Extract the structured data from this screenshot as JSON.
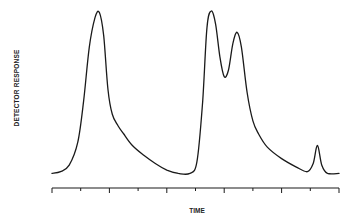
{
  "chart_data": {
    "type": "line",
    "title": "",
    "xlabel": "TIME",
    "ylabel": "DETECTOR RESPONSE",
    "grid": false,
    "legend": null,
    "x_ticks": {
      "count": 11,
      "labels": []
    },
    "y_ticks": {
      "count": 0,
      "labels": []
    },
    "xlim": [
      0,
      10
    ],
    "ylim": [
      0,
      1
    ],
    "series": [
      {
        "name": "chromatogram",
        "x": [
          0.0,
          0.3,
          0.6,
          0.9,
          1.1,
          1.3,
          1.5,
          1.65,
          1.8,
          1.95,
          2.1,
          2.3,
          2.5,
          2.8,
          3.2,
          3.6,
          4.0,
          4.4,
          4.8,
          5.05,
          5.25,
          5.4,
          5.55,
          5.7,
          5.85,
          6.0,
          6.15,
          6.3,
          6.45,
          6.6,
          6.8,
          7.0,
          7.2,
          7.5,
          8.0,
          8.5,
          8.9,
          9.1,
          9.25,
          9.4,
          9.6,
          10.0
        ],
        "y": [
          0.01,
          0.02,
          0.06,
          0.2,
          0.45,
          0.78,
          0.96,
          0.99,
          0.85,
          0.52,
          0.37,
          0.3,
          0.25,
          0.18,
          0.12,
          0.07,
          0.03,
          0.01,
          0.01,
          0.08,
          0.45,
          0.9,
          1.0,
          0.92,
          0.72,
          0.6,
          0.64,
          0.8,
          0.87,
          0.78,
          0.5,
          0.33,
          0.25,
          0.17,
          0.1,
          0.05,
          0.02,
          0.07,
          0.18,
          0.06,
          0.01,
          0.01
        ]
      }
    ],
    "peaks": [
      {
        "label": "peak-1",
        "x": 1.65,
        "height": 0.99
      },
      {
        "label": "peak-2",
        "x": 5.55,
        "height": 1.0
      },
      {
        "label": "peak-3",
        "x": 6.45,
        "height": 0.87
      },
      {
        "label": "peak-4",
        "x": 9.25,
        "height": 0.18
      }
    ]
  },
  "labels": {
    "x": "TIME",
    "y": "DETECTOR RESPONSE"
  }
}
